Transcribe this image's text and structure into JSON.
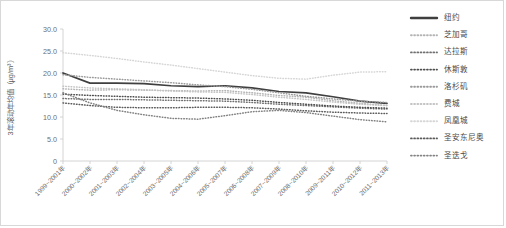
{
  "chart_data": {
    "type": "line",
    "title": "",
    "xlabel": "",
    "ylabel": "3年滚动年均值（μg/m³）",
    "ylim": [
      0,
      30
    ],
    "yticks": [
      "0",
      "5.0",
      "10.0",
      "15.0",
      "20.0",
      "25.0",
      "30.0"
    ],
    "ytick_values": [
      0,
      5,
      10,
      15,
      20,
      25,
      30
    ],
    "grid": false,
    "legend_position": "right",
    "categories": [
      "1999~2001年",
      "2000~2002年",
      "2001~2003年",
      "2002~2004年",
      "2003~2005年",
      "2004~2006年",
      "2005~2007年",
      "2006~2008年",
      "2007~2009年",
      "2008~2010年",
      "2009~2011年",
      "2010~2012年",
      "2011~2013年"
    ],
    "series": [
      {
        "name": "纽约",
        "style": "solid",
        "color": "#3f3f3f",
        "values": [
          20.0,
          17.7,
          17.7,
          17.6,
          17.1,
          16.9,
          17.1,
          16.6,
          15.8,
          15.5,
          14.6,
          13.6,
          13.1
        ]
      },
      {
        "name": "芝加哥",
        "style": "dotted",
        "color": "#b4b4b4",
        "values": [
          16.4,
          16.1,
          16.2,
          16.1,
          16.0,
          15.9,
          16.0,
          15.5,
          14.9,
          14.5,
          13.7,
          13.1,
          12.6
        ]
      },
      {
        "name": "达拉斯",
        "style": "dotted",
        "color": "#6f6f6f",
        "values": [
          14.2,
          14.0,
          14.0,
          13.9,
          13.8,
          13.7,
          13.6,
          13.3,
          12.9,
          12.6,
          12.3,
          12.0,
          11.8
        ]
      },
      {
        "name": "休斯敦",
        "style": "dotted",
        "color": "#4d4d4d",
        "values": [
          15.2,
          14.9,
          14.7,
          14.5,
          14.4,
          14.3,
          14.1,
          13.8,
          13.3,
          12.9,
          12.5,
          12.2,
          12.0
        ]
      },
      {
        "name": "洛杉矶",
        "style": "dotted",
        "color": "#9a9a9a",
        "values": [
          19.6,
          19.0,
          18.6,
          18.2,
          17.8,
          17.3,
          16.9,
          16.3,
          15.5,
          14.7,
          14.1,
          13.6,
          13.3
        ]
      },
      {
        "name": "费城",
        "style": "dotted",
        "color": "#c4c4c4",
        "values": [
          17.0,
          16.6,
          16.4,
          16.2,
          15.9,
          15.7,
          15.6,
          15.1,
          14.5,
          14.0,
          13.4,
          12.9,
          12.6
        ]
      },
      {
        "name": "凤凰城",
        "style": "dotted",
        "color": "#d6d6d6",
        "values": [
          24.6,
          24.0,
          23.3,
          22.5,
          21.8,
          21.0,
          20.2,
          19.4,
          18.8,
          18.6,
          19.5,
          20.2,
          20.3
        ]
      },
      {
        "name": "圣安东尼奥",
        "style": "dotted",
        "color": "#5a5a5a",
        "values": [
          13.2,
          12.6,
          12.2,
          12.1,
          12.1,
          12.2,
          12.2,
          12.1,
          11.8,
          11.4,
          11.1,
          10.9,
          10.8
        ]
      },
      {
        "name": "圣迭戈",
        "style": "dotted",
        "color": "#828282",
        "values": [
          15.5,
          13.2,
          11.5,
          10.5,
          9.7,
          9.5,
          10.3,
          11.2,
          11.5,
          11.0,
          10.2,
          9.4,
          8.9
        ]
      }
    ]
  },
  "legend": {
    "items": [
      {
        "label": "纽约"
      },
      {
        "label": "芝加哥"
      },
      {
        "label": "达拉斯"
      },
      {
        "label": "休斯敦"
      },
      {
        "label": "洛杉矶"
      },
      {
        "label": "费城"
      },
      {
        "label": "凤凰城"
      },
      {
        "label": "圣安东尼奥"
      },
      {
        "label": "圣迭戈"
      }
    ]
  }
}
